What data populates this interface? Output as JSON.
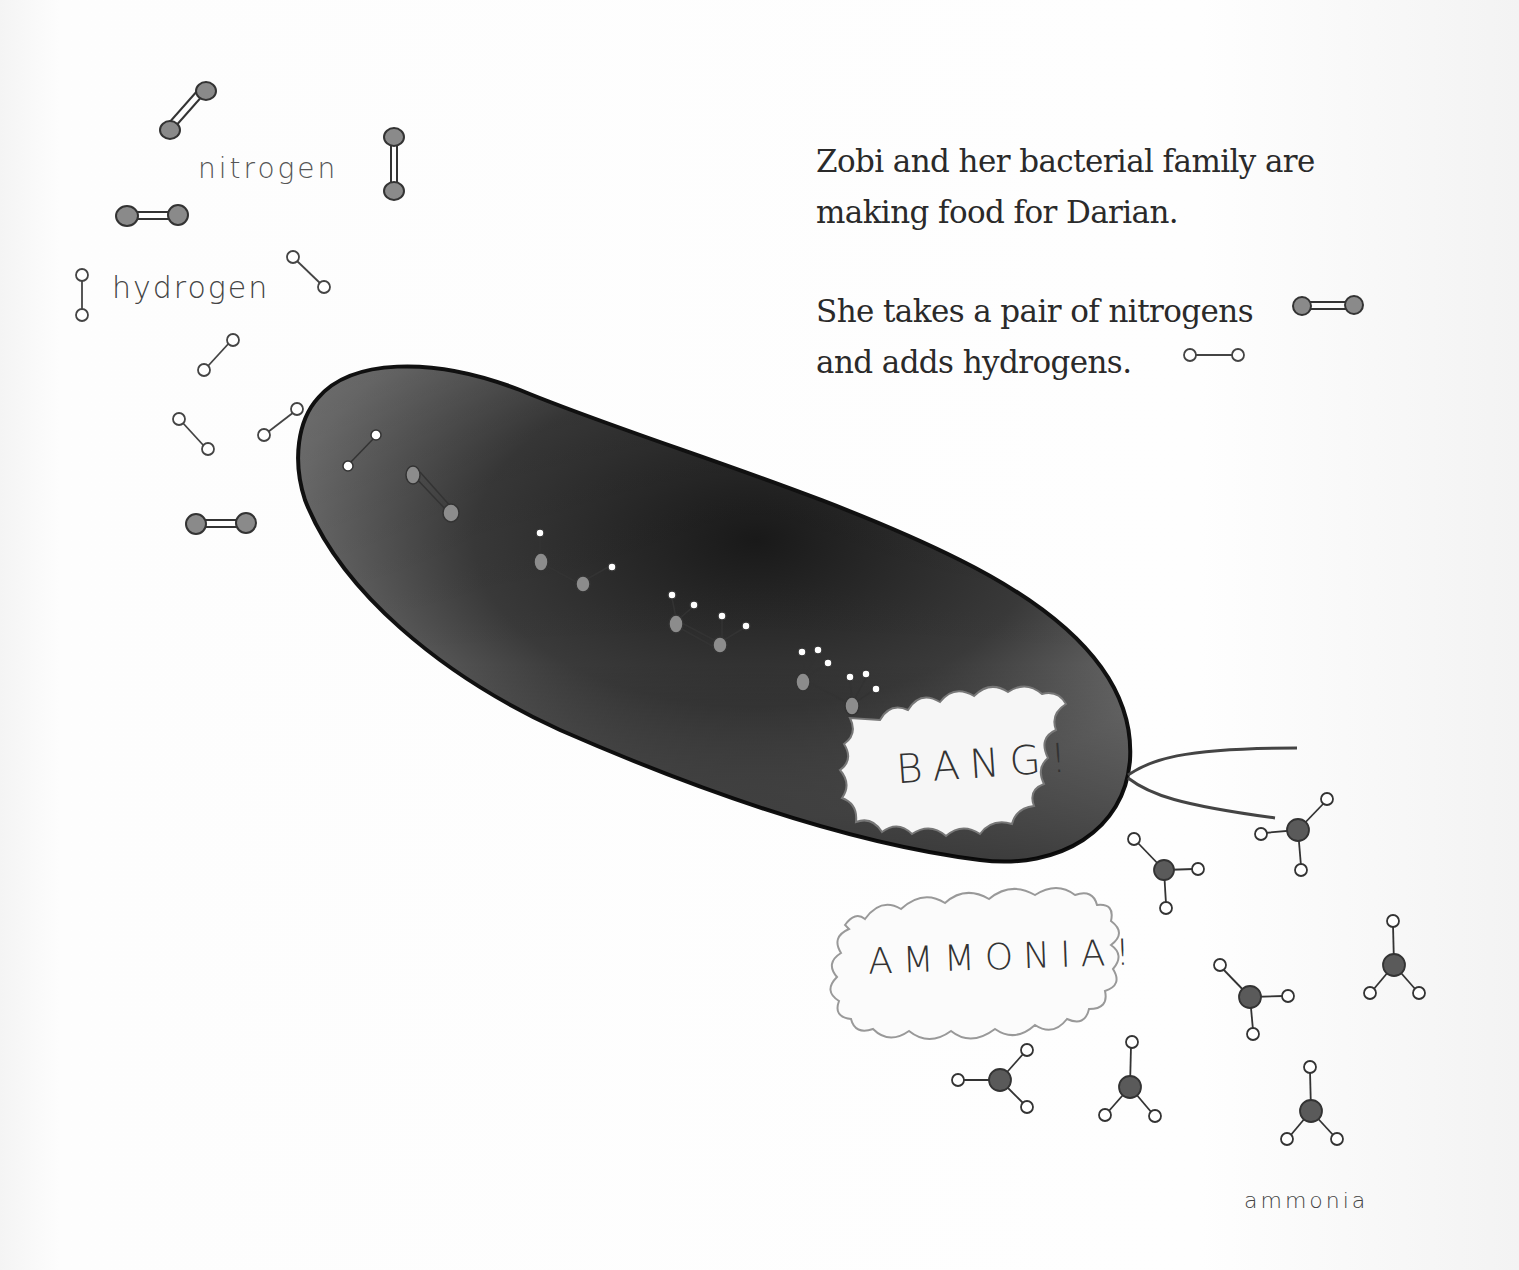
{
  "story": {
    "paragraphs": [
      {
        "lines": [
          "Zobi and her bacterial family are",
          "making food for Darian."
        ]
      },
      {
        "lines": [
          "She takes a pair of nitrogens",
          "and adds hydrogens."
        ]
      }
    ]
  },
  "labels": {
    "nitrogen": "nitrogen",
    "hydrogen": "hydrogen",
    "ammonia": "ammonia"
  },
  "bursts": {
    "bang": "BANG!",
    "ammonia": "AMMONIA!"
  },
  "illustration": {
    "subject": "bacterium-cell",
    "inline_icons": [
      "nitrogen-molecule-icon",
      "hydrogen-molecule-icon"
    ],
    "colors": {
      "nitrogen_atom": "#8a8a8a",
      "ammonia_nitrogen": "#5a5a5a",
      "hydrogen_atom": "#ffffff",
      "ink": "#333333",
      "cell_dark": "#1e1e1e",
      "cell_mid": "#6a6a6a"
    }
  }
}
